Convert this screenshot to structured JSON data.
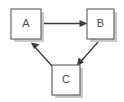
{
  "diagram": {
    "type": "directed-graph",
    "title": "",
    "background_color": "#ffffff",
    "node_fill_color": "#ffffff",
    "node_border_color": "#595959",
    "node_shadow_color": "#c9c9c9",
    "edge_color": "#3d3d3d",
    "label_color": "#4a4a4a",
    "nodes": [
      {
        "id": "A",
        "label": "A",
        "x": 11,
        "y": 9,
        "width": 30,
        "height": 30
      },
      {
        "id": "B",
        "label": "B",
        "x": 87,
        "y": 9,
        "width": 27,
        "height": 30
      },
      {
        "id": "C",
        "label": "C",
        "x": 52,
        "y": 65,
        "width": 28,
        "height": 30
      }
    ],
    "edges": [
      {
        "from": "A",
        "to": "B",
        "label": "",
        "directed": true,
        "arrowhead": "solid-triangle"
      },
      {
        "from": "B",
        "to": "C",
        "label": "",
        "directed": true,
        "arrowhead": "solid-triangle"
      },
      {
        "from": "C",
        "to": "A",
        "label": "",
        "directed": true,
        "arrowhead": "solid-triangle"
      }
    ]
  }
}
